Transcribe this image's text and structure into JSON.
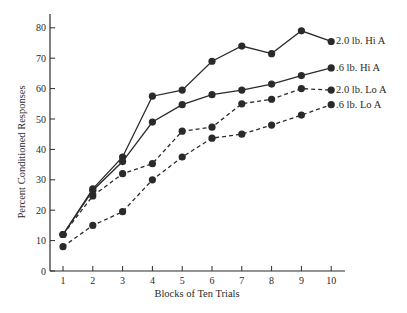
{
  "chart_data": {
    "type": "line",
    "title": "",
    "xlabel": "Blocks of Ten Trials",
    "ylabel": "Percent Conditioned Responses",
    "x": [
      1,
      2,
      3,
      4,
      5,
      6,
      7,
      8,
      9,
      10
    ],
    "xticks": [
      "1",
      "2",
      "3",
      "4",
      "5",
      "6",
      "7",
      "8",
      "9",
      "10"
    ],
    "yticks": [
      "0",
      "10",
      "20",
      "30",
      "40",
      "50",
      "60",
      "70",
      "80"
    ],
    "ylim": [
      0,
      85
    ],
    "xlim": [
      0.6,
      10.5
    ],
    "grid": false,
    "legend_position": "inline-right",
    "series": [
      {
        "name": "2.0 lb. Hi A",
        "style": "solid",
        "values": [
          12,
          27,
          37.5,
          57.5,
          59.5,
          69,
          74,
          71.5,
          79,
          75.5
        ]
      },
      {
        "name": ".6 lb. Hi A",
        "style": "solid",
        "values": [
          12,
          26.5,
          36,
          49,
          54.7,
          58,
          59.5,
          61.5,
          64.3,
          66.8
        ]
      },
      {
        "name": "2.0 lb. Lo A",
        "style": "dashed",
        "values": [
          12,
          24.7,
          32,
          35.3,
          46,
          47.3,
          55,
          56.5,
          60,
          59.5
        ]
      },
      {
        "name": ".6 lb. Lo A",
        "style": "dashed",
        "values": [
          8,
          15,
          19.5,
          30,
          37.5,
          43.7,
          45,
          48,
          51.3,
          54.7
        ]
      }
    ]
  },
  "colors": {
    "ink": "#2a2a2a",
    "background": "#ffffff"
  }
}
